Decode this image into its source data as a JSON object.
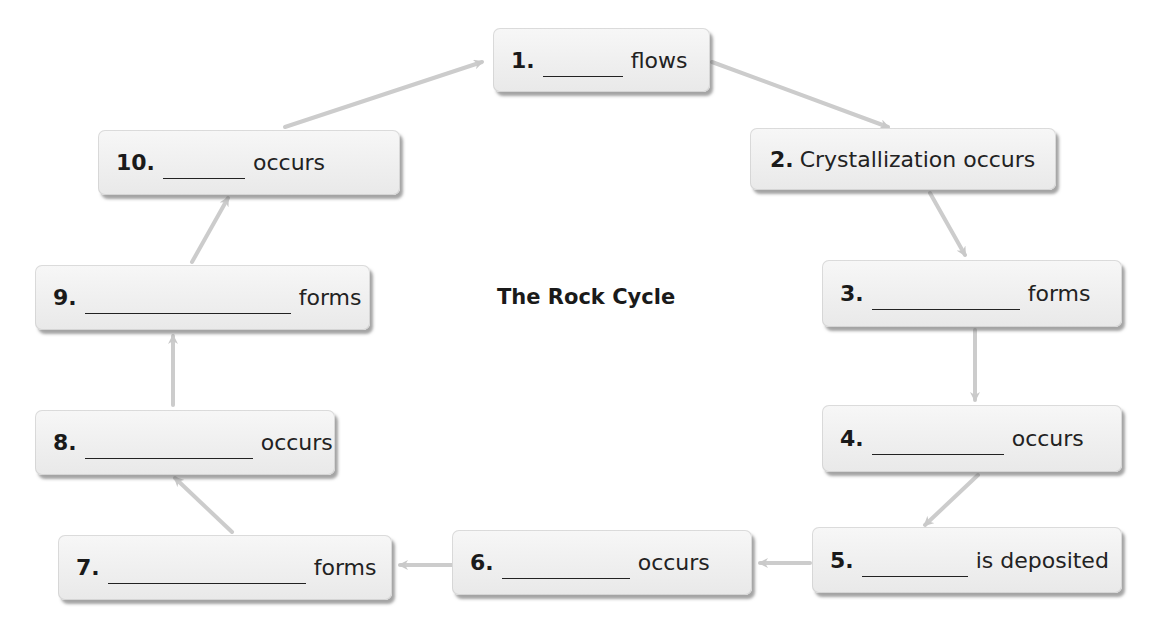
{
  "diagram": {
    "title": "The Rock Cycle",
    "colors": {
      "box_fill": "#efefef",
      "box_shadow": "#5a5a5a",
      "arrow": "#c9c9c9",
      "text": "#1a1a1a"
    },
    "steps": [
      {
        "number": "1.",
        "blank": true,
        "text": "flows"
      },
      {
        "number": "2.",
        "blank": false,
        "text": "Crystallization occurs"
      },
      {
        "number": "3.",
        "blank": true,
        "text": "forms"
      },
      {
        "number": "4.",
        "blank": true,
        "text": "occurs"
      },
      {
        "number": "5.",
        "blank": true,
        "text": "is deposited"
      },
      {
        "number": "6.",
        "blank": true,
        "text": "occurs"
      },
      {
        "number": "7.",
        "blank": true,
        "text": "forms"
      },
      {
        "number": "8.",
        "blank": true,
        "text": "occurs"
      },
      {
        "number": "9.",
        "blank": true,
        "text": "forms"
      },
      {
        "number": "10.",
        "blank": true,
        "text": "occurs"
      }
    ],
    "flow": [
      "1→2",
      "2→3",
      "3→4",
      "4→5",
      "5→6",
      "6→7",
      "7→8",
      "8→9",
      "9→10",
      "10→1"
    ]
  }
}
